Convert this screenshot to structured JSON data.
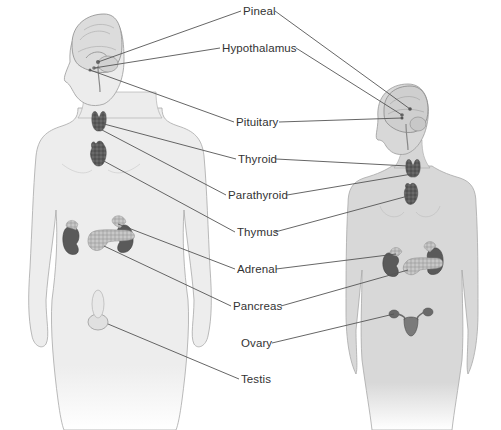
{
  "diagram": {
    "type": "anatomical-labeled-illustration",
    "colors": {
      "background": "#ffffff",
      "male_skin": "#ececec",
      "female_skin": "#d6d6d6",
      "outline": "#9a9a9a",
      "organ_dark": "#5a5a5a",
      "organ_light": "#b8b8b8",
      "leader_line": "#555555",
      "label_text": "#333333"
    },
    "labels": [
      {
        "id": "pineal",
        "text": "Pineal",
        "x": 243,
        "y": 5
      },
      {
        "id": "hypothalamus",
        "text": "Hypothalamus",
        "x": 222,
        "y": 42
      },
      {
        "id": "pituitary",
        "text": "Pituitary",
        "x": 236,
        "y": 116
      },
      {
        "id": "thyroid",
        "text": "Thyroid",
        "x": 238,
        "y": 153
      },
      {
        "id": "parathyroid",
        "text": "Parathyroid",
        "x": 228,
        "y": 189
      },
      {
        "id": "thymus",
        "text": "Thymus",
        "x": 237,
        "y": 226
      },
      {
        "id": "adrenal",
        "text": "Adrenal",
        "x": 237,
        "y": 263
      },
      {
        "id": "pancreas",
        "text": "Pancreas",
        "x": 233,
        "y": 300
      },
      {
        "id": "ovary",
        "text": "Ovary",
        "x": 241,
        "y": 337
      },
      {
        "id": "testis",
        "text": "Testis",
        "x": 241,
        "y": 373
      }
    ]
  }
}
